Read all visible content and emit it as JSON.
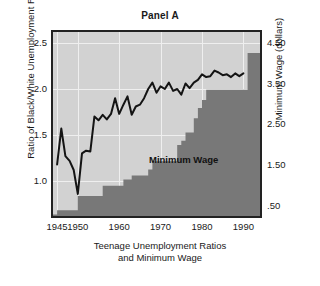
{
  "chart_data": {
    "type": "area",
    "title": "Panel A",
    "xlabel_lines": [
      "Teenage Unemployment Ratios",
      "and Minimum Wage"
    ],
    "ylabel_left": "Ratio of Black/White Unemployment Rates",
    "ylabel_right": "Minimum Wage (dollars)",
    "annotation": "Minimum Wage",
    "grid": true,
    "legend_position": "inline-annotation",
    "xlim": [
      1944,
      1994
    ],
    "xticks": [
      1945,
      1950,
      1960,
      1970,
      1980,
      1990
    ],
    "xticklabels": [
      "1945",
      "1950",
      "1960",
      "1970",
      "1980",
      "1990"
    ],
    "ylim_left": [
      0.62,
      2.62
    ],
    "yticks_left": [
      1.0,
      1.5,
      2.0,
      2.5
    ],
    "yticklabels_left": [
      "1.0",
      "1.5",
      "2.0",
      "2.5"
    ],
    "ylim_right": [
      0.26,
      4.76
    ],
    "yticks_right": [
      0.5,
      1.5,
      2.5,
      3.5,
      4.5
    ],
    "yticklabels_right": [
      ".50",
      "1.50",
      "2.50",
      "3.50",
      "4.50"
    ],
    "colors": {
      "plot_background": "#d2d2d2",
      "wage_fill": "#787878",
      "ratio_line": "#141414",
      "gridline": "#efefef",
      "frame": "#222222",
      "text": "#1a1a1a"
    },
    "series": [
      {
        "name": "Minimum Wage",
        "type": "step",
        "axis": "right",
        "units": "dollars",
        "x": [
          1944,
          1945,
          1950,
          1956,
          1961,
          1963,
          1967,
          1968,
          1974,
          1975,
          1976,
          1978,
          1979,
          1980,
          1981,
          1990,
          1991,
          1994
        ],
        "values": [
          0.3,
          0.4,
          0.75,
          1.0,
          1.15,
          1.25,
          1.4,
          1.6,
          2.0,
          2.1,
          2.3,
          2.65,
          2.9,
          3.1,
          3.35,
          3.35,
          4.25,
          4.25
        ]
      },
      {
        "name": "Ratio of Black/White Unemployment Rates",
        "type": "line",
        "axis": "left",
        "x": [
          1945,
          1946,
          1947,
          1948,
          1949,
          1950,
          1951,
          1952,
          1953,
          1954,
          1955,
          1956,
          1957,
          1958,
          1959,
          1960,
          1961,
          1962,
          1963,
          1964,
          1965,
          1966,
          1967,
          1968,
          1969,
          1970,
          1971,
          1972,
          1973,
          1974,
          1975,
          1976,
          1977,
          1978,
          1979,
          1980,
          1981,
          1982,
          1983,
          1984,
          1985,
          1986,
          1987,
          1988,
          1989,
          1990
        ],
        "values": [
          1.18,
          1.57,
          1.27,
          1.22,
          1.12,
          0.86,
          1.3,
          1.33,
          1.32,
          1.7,
          1.66,
          1.72,
          1.67,
          1.73,
          1.9,
          1.73,
          1.83,
          1.92,
          1.72,
          1.81,
          1.83,
          1.9,
          2.0,
          2.07,
          1.96,
          2.03,
          2.0,
          2.07,
          1.98,
          2.0,
          1.94,
          2.06,
          2.01,
          2.07,
          2.1,
          2.16,
          2.13,
          2.14,
          2.2,
          2.18,
          2.15,
          2.16,
          2.13,
          2.17,
          2.14,
          2.17
        ]
      }
    ]
  }
}
